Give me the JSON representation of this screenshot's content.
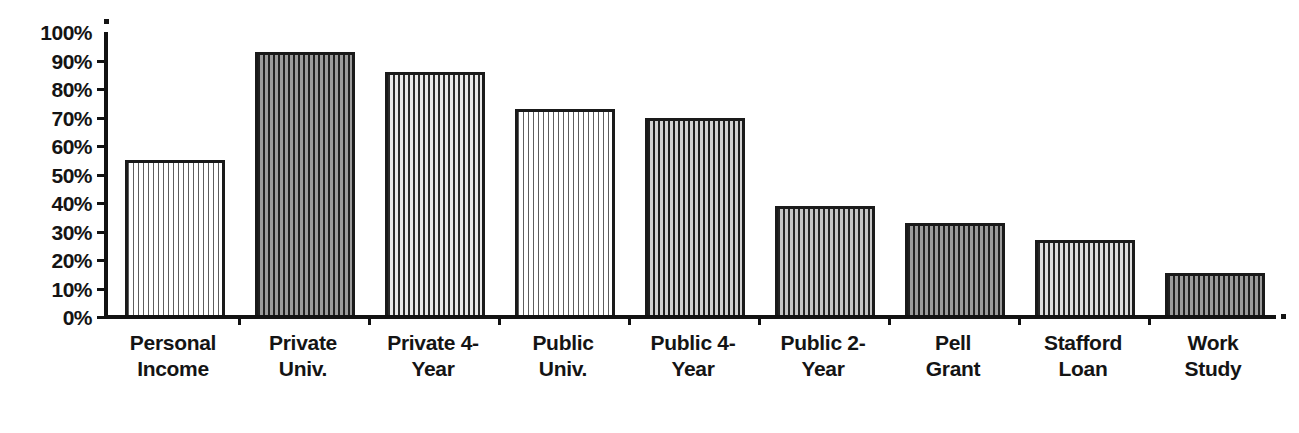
{
  "chart_data": {
    "type": "bar",
    "title": "",
    "subtitle": "",
    "xlabel": "",
    "ylabel": "",
    "ylim": [
      0,
      100
    ],
    "grid": false,
    "legend": "none",
    "y_tick_labels": [
      "100%",
      "90%",
      "80%",
      "70%",
      "60%",
      "50%",
      "40%",
      "30%",
      "20%",
      "10%",
      "0%"
    ],
    "y_tick_values": [
      100,
      90,
      80,
      70,
      60,
      50,
      40,
      30,
      20,
      10,
      0
    ],
    "categories": [
      "Personal Income",
      "Private Univ.",
      "Private 4-Year",
      "Public Univ.",
      "Public 4-Year",
      "Public 2-Year",
      "Pell Grant",
      "Stafford Loan",
      "Work Study"
    ],
    "values": [
      55,
      93,
      86,
      73,
      70,
      39,
      33,
      27,
      15.5
    ],
    "value_labels": [
      "55%",
      "93%",
      "86%",
      "73%",
      "70%",
      "39%",
      "33%",
      "27%",
      "16%"
    ],
    "bars": [
      {
        "label_line1": "Personal",
        "label_line2": "Income",
        "value": 55,
        "pattern": "pat-light-vertical"
      },
      {
        "label_line1": "Private",
        "label_line2": "Univ.",
        "value": 93,
        "pattern": "pat-dark-weave"
      },
      {
        "label_line1": "Private 4-",
        "label_line2": "Year",
        "value": 86,
        "pattern": "pat-mid-checker"
      },
      {
        "label_line1": "Public",
        "label_line2": "Univ.",
        "value": 73,
        "pattern": "pat-light-vertical"
      },
      {
        "label_line1": "Public 4-",
        "label_line2": "Year",
        "value": 70,
        "pattern": "pat-dark-checker"
      },
      {
        "label_line1": "Public 2-",
        "label_line2": "Year",
        "value": 39,
        "pattern": "pat-grid-dark"
      },
      {
        "label_line1": "Pell",
        "label_line2": "Grant",
        "value": 33,
        "pattern": "pat-dark-weave"
      },
      {
        "label_line1": "Stafford",
        "label_line2": "Loan",
        "value": 27,
        "pattern": "pat-grid-mid"
      },
      {
        "label_line1": "Work",
        "label_line2": "Study",
        "value": 15.5,
        "pattern": "pat-dark-weave"
      }
    ],
    "colors": {
      "axis": "#121212",
      "text": "#141414",
      "background": "#ffffff",
      "bar_outline": "#1a1a1a"
    }
  }
}
